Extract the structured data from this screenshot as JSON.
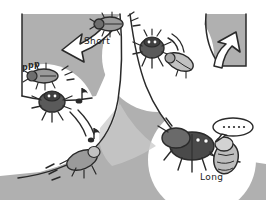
{
  "figure": {
    "type": "behavioral-pathway-diagram",
    "style": "hand-drawn line illustration, grayscale",
    "background_color": "#ffffff",
    "fill_gray": "#b0b0b0",
    "fill_gray_light": "#c9c9c9",
    "fill_gray_dark": "#6e6e6e",
    "body_dark": "#5a5a5a",
    "ink_color": "#1d1d1d",
    "arrow_fill": "#ffffff"
  },
  "labels": {
    "short": "Short",
    "long": "Long"
  },
  "branches": [
    {
      "id": "short",
      "label": "Short",
      "position": "upper-center",
      "arrow": "recycle-arrow-left",
      "arrow_direction": "down-left",
      "outcome": "rejection / struggle"
    },
    {
      "id": "long",
      "label": "Long",
      "position": "lower-right",
      "arrow": "recycle-arrow-right",
      "arrow_direction": "up-right",
      "outcome": "acceptance / quiet"
    }
  ],
  "annotations": {
    "stridulation_marks": "ppp",
    "motion_marks": "'''",
    "impact_marks": "///",
    "music_notes": "♪",
    "speech_bubble_text": "·····"
  },
  "actors": [
    {
      "id": "short-beetle-upper",
      "name": "beetle-dorsal-short",
      "view": "dorsal",
      "branch": "short"
    },
    {
      "id": "short-beetle-front",
      "name": "beetle-frontal-struggling",
      "view": "frontal",
      "branch": "short"
    },
    {
      "id": "short-partner",
      "name": "beetle-partner-pale",
      "view": "lateral",
      "branch": "short"
    },
    {
      "id": "reject-beetle-a",
      "name": "beetle-leaving-upper-left",
      "view": "dorsal",
      "branch": "short"
    },
    {
      "id": "reject-beetle-b",
      "name": "beetle-leaving-mid-left",
      "view": "frontal",
      "branch": "short"
    },
    {
      "id": "reject-beetle-c",
      "name": "beetle-leaving-lower-left",
      "view": "lateral",
      "branch": "short"
    },
    {
      "id": "long-beetle-male",
      "name": "beetle-male-dark-large",
      "view": "dorsal",
      "branch": "long"
    },
    {
      "id": "long-beetle-female",
      "name": "beetle-female-pale",
      "view": "lateral",
      "branch": "long"
    }
  ]
}
